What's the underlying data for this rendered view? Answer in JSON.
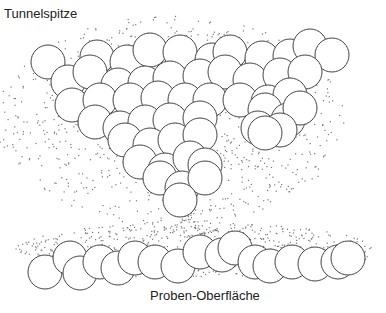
{
  "diagram": {
    "labels": {
      "tip": "Tunnelspitze",
      "surface": "Proben-Oberfläche"
    },
    "colors": {
      "stroke": "#444444",
      "stipple": "#777777",
      "background": "#ffffff"
    },
    "atom_radius": 17,
    "tip_atoms": [
      [
        48,
        62
      ],
      [
        97,
        57
      ],
      [
        127,
        62
      ],
      [
        150,
        50
      ],
      [
        180,
        52
      ],
      [
        212,
        60
      ],
      [
        230,
        52
      ],
      [
        262,
        58
      ],
      [
        290,
        56
      ],
      [
        310,
        46
      ],
      [
        332,
        55
      ],
      [
        68,
        82
      ],
      [
        90,
        72
      ],
      [
        118,
        85
      ],
      [
        145,
        83
      ],
      [
        170,
        78
      ],
      [
        200,
        76
      ],
      [
        225,
        72
      ],
      [
        250,
        80
      ],
      [
        280,
        75
      ],
      [
        305,
        72
      ],
      [
        72,
        105
      ],
      [
        100,
        100
      ],
      [
        130,
        100
      ],
      [
        158,
        98
      ],
      [
        185,
        100
      ],
      [
        210,
        100
      ],
      [
        240,
        100
      ],
      [
        268,
        102
      ],
      [
        290,
        95
      ],
      [
        95,
        122
      ],
      [
        120,
        128
      ],
      [
        145,
        122
      ],
      [
        170,
        120
      ],
      [
        200,
        118
      ],
      [
        265,
        110
      ],
      [
        288,
        120
      ],
      [
        300,
        108
      ],
      [
        125,
        140
      ],
      [
        150,
        145
      ],
      [
        175,
        140
      ],
      [
        200,
        135
      ],
      [
        258,
        128
      ],
      [
        280,
        130
      ],
      [
        140,
        162
      ],
      [
        165,
        170
      ],
      [
        190,
        158
      ],
      [
        205,
        165
      ],
      [
        265,
        133
      ],
      [
        160,
        178
      ],
      [
        182,
        188
      ],
      [
        205,
        178
      ],
      [
        180,
        200
      ]
    ],
    "surface_atoms": [
      [
        45,
        272
      ],
      [
        70,
        258
      ],
      [
        80,
        273
      ],
      [
        100,
        262
      ],
      [
        118,
        268
      ],
      [
        135,
        258
      ],
      [
        155,
        262
      ],
      [
        178,
        266
      ],
      [
        200,
        252
      ],
      [
        222,
        255
      ],
      [
        235,
        248
      ],
      [
        255,
        262
      ],
      [
        270,
        266
      ],
      [
        292,
        262
      ],
      [
        315,
        264
      ],
      [
        338,
        262
      ],
      [
        348,
        258
      ]
    ]
  }
}
